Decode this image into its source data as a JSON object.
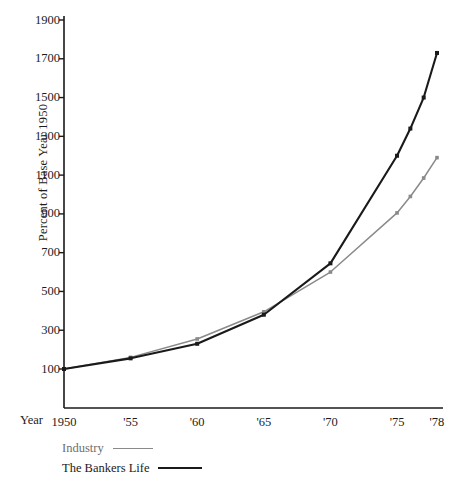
{
  "chart_data": {
    "type": "line",
    "title": "",
    "xlabel": "Year",
    "ylabel": "Percent of Base Year 1950",
    "xlim": [
      1950,
      1978
    ],
    "ylim": [
      0,
      1900
    ],
    "yticks": [
      100,
      300,
      500,
      700,
      900,
      1100,
      1300,
      1500,
      1700,
      1900
    ],
    "ytick_labels": [
      "100",
      "300",
      "500",
      "700",
      "900",
      "1100",
      "1300",
      "1500",
      "1700",
      "1900"
    ],
    "xticks": [
      1950,
      1955,
      1960,
      1965,
      1970,
      1975,
      1978
    ],
    "xtick_labels": [
      "1950",
      "'55",
      "'60",
      "'65",
      "'70",
      "'75",
      "'78"
    ],
    "grid": false,
    "legend_position": "below-left",
    "series": [
      {
        "name": "Industry",
        "color": "#8a8a8a",
        "marker": "square",
        "x": [
          1950,
          1955,
          1960,
          1965,
          1970,
          1975,
          1976,
          1977,
          1978
        ],
        "values": [
          100,
          160,
          255,
          395,
          600,
          905,
          990,
          1085,
          1190
        ]
      },
      {
        "name": "The Bankers Life",
        "color": "#1a1a1a",
        "marker": "square",
        "x": [
          1950,
          1955,
          1960,
          1965,
          1970,
          1975,
          1976,
          1977,
          1978
        ],
        "values": [
          100,
          155,
          230,
          380,
          645,
          1200,
          1340,
          1500,
          1730
        ]
      }
    ]
  },
  "axis": {
    "y_title": "Percent of Base Year 1950",
    "x_title": "Year",
    "y_labels": [
      "1900",
      "1700",
      "1500",
      "1300",
      "1100",
      "900",
      "700",
      "500",
      "300",
      "100"
    ],
    "x_labels": [
      "1950",
      "'55",
      "'60",
      "'65",
      "'70",
      "'75",
      "'78"
    ]
  },
  "legend": {
    "items": [
      {
        "label": "Industry",
        "color": "#8a8a8a"
      },
      {
        "label": "The Bankers Life",
        "color": "#1a1a1a"
      }
    ]
  }
}
